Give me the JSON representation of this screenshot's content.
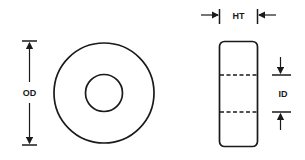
{
  "diagram": {
    "type": "toroid dimension drawing",
    "front_view": {
      "label_outer_diameter": "OD",
      "outer_circle": {
        "cx": 104,
        "cy": 93,
        "r": 50
      },
      "inner_circle": {
        "cx": 104,
        "cy": 93,
        "r": 18
      }
    },
    "side_view": {
      "label_height": "HT",
      "label_inner_diameter": "ID",
      "body": {
        "x": 219,
        "y": 41,
        "width": 38,
        "height": 105,
        "corner_radius": 5
      },
      "dashed_lines_y": [
        75,
        112
      ]
    },
    "colors": {
      "stroke": "#1a1a1a",
      "background": "#ffffff"
    }
  }
}
